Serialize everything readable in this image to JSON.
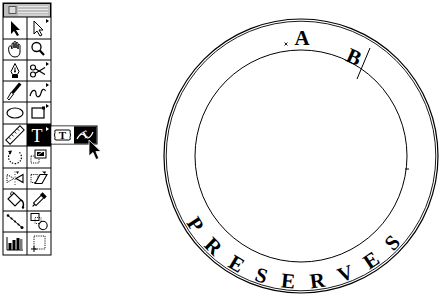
{
  "colors": {
    "ink": "#000000",
    "paper": "#ffffff",
    "titlebar": "#bdbdbd",
    "selected_tool_bg": "#000000"
  },
  "toolbox": {
    "title_bar": {
      "close_box_icon": "close-box-icon"
    },
    "selected_tool": "type",
    "tools": [
      {
        "row": 0,
        "col": 0,
        "name": "selection",
        "icon": "selection-arrow-icon",
        "submenu": false
      },
      {
        "row": 0,
        "col": 1,
        "name": "direct-selection",
        "icon": "hollow-arrow-icon",
        "submenu": true
      },
      {
        "row": 1,
        "col": 0,
        "name": "hand",
        "icon": "hand-icon",
        "submenu": false
      },
      {
        "row": 1,
        "col": 1,
        "name": "zoom",
        "icon": "magnifier-icon",
        "submenu": false
      },
      {
        "row": 2,
        "col": 0,
        "name": "pen",
        "icon": "pen-nib-icon",
        "submenu": false
      },
      {
        "row": 2,
        "col": 1,
        "name": "scissors",
        "icon": "scissors-icon",
        "submenu": true
      },
      {
        "row": 3,
        "col": 0,
        "name": "brush",
        "icon": "brush-icon",
        "submenu": false
      },
      {
        "row": 3,
        "col": 1,
        "name": "freehand",
        "icon": "freehand-squiggle-icon",
        "submenu": true
      },
      {
        "row": 4,
        "col": 0,
        "name": "oval",
        "icon": "ellipse-icon",
        "submenu": false
      },
      {
        "row": 4,
        "col": 1,
        "name": "rectangle",
        "icon": "rectangle-icon",
        "submenu": true
      },
      {
        "row": 5,
        "col": 0,
        "name": "measure",
        "icon": "ruler-icon",
        "submenu": false
      },
      {
        "row": 5,
        "col": 1,
        "name": "type",
        "icon": "type-t-icon",
        "glyph": "T",
        "submenu": true,
        "selected": true
      },
      {
        "row": 6,
        "col": 0,
        "name": "rotate",
        "icon": "rotate-icon",
        "submenu": false
      },
      {
        "row": 6,
        "col": 1,
        "name": "scale",
        "icon": "scale-icon",
        "submenu": false
      },
      {
        "row": 7,
        "col": 0,
        "name": "reflect",
        "icon": "reflect-icon",
        "submenu": false
      },
      {
        "row": 7,
        "col": 1,
        "name": "shear",
        "icon": "shear-icon",
        "submenu": false
      },
      {
        "row": 8,
        "col": 0,
        "name": "paint-bucket",
        "icon": "paint-bucket-icon",
        "submenu": false
      },
      {
        "row": 8,
        "col": 1,
        "name": "eyedropper",
        "icon": "eyedropper-icon",
        "submenu": false
      },
      {
        "row": 9,
        "col": 0,
        "name": "blend",
        "icon": "blend-icon",
        "submenu": false
      },
      {
        "row": 9,
        "col": 1,
        "name": "auto-trace",
        "icon": "auto-trace-icon",
        "submenu": false
      },
      {
        "row": 10,
        "col": 0,
        "name": "graph",
        "icon": "bar-graph-icon",
        "submenu": false
      },
      {
        "row": 10,
        "col": 1,
        "name": "page",
        "icon": "page-icon",
        "submenu": false
      }
    ]
  },
  "flyout": {
    "parent_tool": "type",
    "items": [
      {
        "name": "area-type",
        "icon": "area-type-icon",
        "glyph": "T",
        "highlighted": false
      },
      {
        "name": "path-type",
        "icon": "path-type-icon",
        "glyph": "T",
        "highlighted": true
      }
    ]
  },
  "cursor": {
    "type": "arrow-pointer",
    "x": 89,
    "y": 140
  },
  "artboard": {
    "label_a": "A",
    "label_b": "B",
    "path_text": "PRESERVES",
    "outer_ring": {
      "cx": 301,
      "cy": 156,
      "r": 137
    },
    "inner_circle": {
      "cx": 301,
      "cy": 156,
      "r": 106
    }
  }
}
